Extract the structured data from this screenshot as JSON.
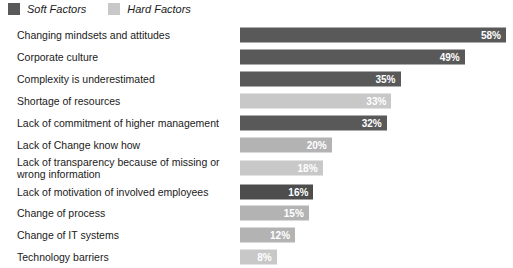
{
  "legend": {
    "items": [
      {
        "label": "Soft Factors",
        "color": "#595959",
        "swatch_name": "legend-swatch-soft-factors"
      },
      {
        "label": "Hard Factors",
        "color": "#c8c8c8",
        "swatch_name": "legend-swatch-hard-factors"
      }
    ]
  },
  "colors": {
    "soft": "#595959",
    "soft_dark": "#4d4d4d",
    "hard": "#c8c8c8",
    "hard_mid": "#b3b3b3",
    "value_text": "#ffffff",
    "label_text": "#1a1a1a",
    "background": "#ffffff"
  },
  "chart_data": {
    "type": "bar",
    "orientation": "horizontal",
    "title": "",
    "subtitle": "",
    "xlabel": "",
    "ylabel": "",
    "xlim": [
      0,
      58
    ],
    "grid": false,
    "legend_position": "top-left",
    "value_suffix": "%",
    "categories": [
      "Changing mindsets and attitudes",
      "Corporate culture",
      "Complexity is underestimated",
      "Shortage of resources",
      "Lack of commitment of higher management",
      "Lack of Change know how",
      "Lack of transparency because of missing or wrong information",
      "Lack of motivation of involved employees",
      "Change of process",
      "Change of IT systems",
      "Technology barriers"
    ],
    "values": [
      58,
      49,
      35,
      33,
      32,
      20,
      18,
      16,
      15,
      12,
      8
    ],
    "value_labels": [
      "58%",
      "49%",
      "35%",
      "33%",
      "32%",
      "20%",
      "18%",
      "16%",
      "15%",
      "12%",
      "8%"
    ],
    "series_of": [
      "Soft Factors",
      "Soft Factors",
      "Soft Factors",
      "Hard Factors",
      "Soft Factors",
      "Hard Factors",
      "Hard Factors",
      "Soft Factors",
      "Hard Factors",
      "Hard Factors",
      "Hard Factors"
    ],
    "series": [
      {
        "name": "Soft Factors",
        "color": "#595959"
      },
      {
        "name": "Hard Factors",
        "color": "#c8c8c8"
      }
    ]
  },
  "rows": [
    {
      "label": "Changing mindsets and attitudes",
      "value": 58,
      "value_label": "58%",
      "color": "#595959",
      "type": "soft",
      "style": ""
    },
    {
      "label": "Corporate culture",
      "value": 49,
      "value_label": "49%",
      "color": "#595959",
      "type": "soft",
      "style": ""
    },
    {
      "label": "Complexity is underestimated",
      "value": 35,
      "value_label": "35%",
      "color": "#595959",
      "type": "soft",
      "style": ""
    },
    {
      "label": "Shortage of resources",
      "value": 33,
      "value_label": "33%",
      "color": "#c8c8c8",
      "type": "hard",
      "style": ""
    },
    {
      "label": "Lack of commitment of higher management",
      "value": 32,
      "value_label": "32%",
      "color": "#595959",
      "type": "soft",
      "style": ""
    },
    {
      "label": "Lack of Change know how",
      "value": 20,
      "value_label": "20%",
      "color": "#b3b3b3",
      "type": "hard",
      "style": "tight"
    },
    {
      "label": "Lack of transparency because of missing or\nwrong information",
      "value": 18,
      "value_label": "18%",
      "color": "#c8c8c8",
      "type": "hard",
      "style": "tall"
    },
    {
      "label": "Lack of motivation of involved employees",
      "value": 16,
      "value_label": "16%",
      "color": "#4d4d4d",
      "type": "soft",
      "style": "tight"
    },
    {
      "label": "Change of process",
      "value": 15,
      "value_label": "15%",
      "color": "#b3b3b3",
      "type": "hard",
      "style": ""
    },
    {
      "label": "Change of IT systems",
      "value": 12,
      "value_label": "12%",
      "color": "#b3b3b3",
      "type": "hard",
      "style": ""
    },
    {
      "label": "Technology barriers",
      "value": 8,
      "value_label": "8%",
      "color": "#c8c8c8",
      "type": "hard",
      "style": ""
    }
  ],
  "scale": {
    "max_value": 58,
    "max_pixels": 266
  }
}
